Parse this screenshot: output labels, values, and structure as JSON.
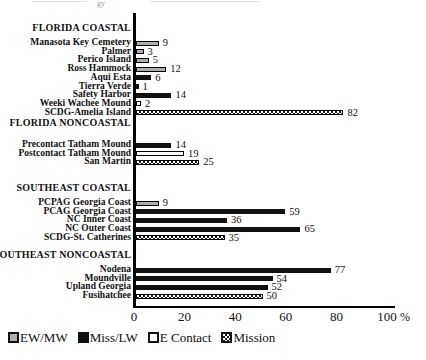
{
  "scan_artifact": {
    "text": "gy"
  },
  "chart_data": {
    "type": "bar",
    "orientation": "horizontal",
    "unit": "%",
    "xlim": [
      0,
      100
    ],
    "x_ticks": [
      "0",
      "20",
      "40",
      "60",
      "80",
      "100"
    ],
    "grid": false,
    "legend_position": "bottom-left",
    "groups": [
      {
        "label": "FLORIDA COASTAL",
        "sites": [
          {
            "label": "Manasota Key Cemetery",
            "value": 9,
            "series": "EW/MW"
          },
          {
            "label": "Palmer",
            "value": 3,
            "series": "EW/MW"
          },
          {
            "label": "Perico Island",
            "value": 5,
            "series": "EW/MW"
          },
          {
            "label": "Ross Hammock",
            "value": 12,
            "series": "EW/MW"
          },
          {
            "label": "Aqui Esta",
            "value": 6,
            "series": "Miss/LW"
          },
          {
            "label": "Tierra Verde",
            "value": 1,
            "series": "Miss/LW"
          },
          {
            "label": "Safety Harbor",
            "value": 14,
            "series": "Miss/LW"
          },
          {
            "label": "Weeki Wachee Mound",
            "value": 2,
            "series": "E Contact"
          },
          {
            "label": "SCDG-Amelia Island",
            "value": 82,
            "series": "Mission"
          }
        ]
      },
      {
        "label": "FLORIDA NONCOASTAL",
        "sites": [
          {
            "label": "Precontact Tatham Mound",
            "value": 14,
            "series": "Miss/LW"
          },
          {
            "label": "Postcontact Tatham Mound",
            "value": 19,
            "series": "E Contact"
          },
          {
            "label": "San Martin",
            "value": 25,
            "series": "Mission"
          }
        ]
      },
      {
        "label": "SOUTHEAST COASTAL",
        "sites": [
          {
            "label": "PCPAG Georgia Coast",
            "value": 9,
            "series": "EW/MW"
          },
          {
            "label": "PCAG Georgia Coast",
            "value": 59,
            "series": "Miss/LW"
          },
          {
            "label": "NC Inner Coast",
            "value": 36,
            "series": "Miss/LW"
          },
          {
            "label": "NC Outer Coast",
            "value": 65,
            "series": "Miss/LW"
          },
          {
            "label": "SCDG-St. Catherines",
            "value": 35,
            "series": "Mission"
          }
        ]
      },
      {
        "label": "SOUTHEAST NONCOASTAL",
        "sites": [
          {
            "label": "Nodena",
            "value": 77,
            "series": "Miss/LW"
          },
          {
            "label": "Moundville",
            "value": 54,
            "series": "Miss/LW"
          },
          {
            "label": "Upland Georgia",
            "value": 52,
            "series": "Miss/LW"
          },
          {
            "label": "Fusihatchee",
            "value": 50,
            "series": "Mission"
          }
        ]
      }
    ],
    "legend": [
      {
        "label": "EW/MW",
        "swatch": "gray",
        "color": "#aeaeae"
      },
      {
        "label": "Miss/LW",
        "swatch": "black",
        "color": "#111111"
      },
      {
        "label": "E Contact",
        "swatch": "white",
        "color": "#ffffff"
      },
      {
        "label": "Mission",
        "swatch": "crosshatch",
        "color": "#ffffff"
      }
    ]
  }
}
